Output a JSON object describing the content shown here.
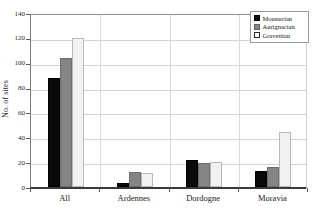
{
  "chart_data": {
    "type": "bar",
    "title": "",
    "xlabel": "",
    "ylabel": "No. of sites",
    "ylim": [
      0,
      140
    ],
    "ytick_step": 20,
    "yticks": [
      0,
      20,
      40,
      60,
      80,
      100,
      120,
      140
    ],
    "grid": true,
    "legend_position": "top-right",
    "categories": [
      "All",
      "Ardennes",
      "Dordogne",
      "Moravia"
    ],
    "series": [
      {
        "name": "Mousterian",
        "color": "#0a0a0a",
        "values": [
          87.5,
          3,
          21.5,
          13
        ]
      },
      {
        "name": "Aurignacian",
        "color": "#858585",
        "values": [
          104,
          12,
          19.5,
          16.5
        ]
      },
      {
        "name": "Gravettian",
        "color": "#f1f1f1",
        "values": [
          120,
          11,
          20,
          44
        ]
      }
    ]
  }
}
